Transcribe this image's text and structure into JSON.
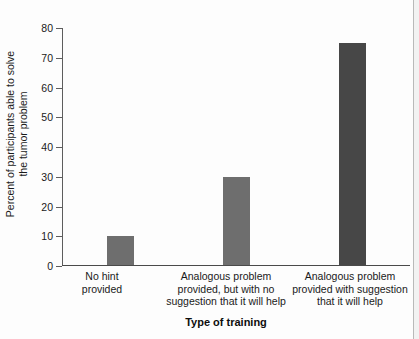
{
  "chart_data": {
    "type": "bar",
    "title": "",
    "subtitle": "",
    "xlabel": "Type of training",
    "ylabel_lines": [
      "Percent of participants able to solve",
      "the tumor problem"
    ],
    "ylabel": "Percent of participants able to solve the tumor problem",
    "categories": [
      "No hint provided",
      "Analogous problem provided, but with no suggestion that it will help",
      "Analogous problem provided with suggestion that it will help"
    ],
    "category_lines": [
      [
        "No hint",
        "provided"
      ],
      [
        "Analogous problem",
        "provided, but with no",
        "suggestion that it will help"
      ],
      [
        "Analogous problem",
        "provided with suggestion",
        "that it will help"
      ]
    ],
    "values": [
      10,
      30,
      75
    ],
    "ylim": [
      0,
      80
    ],
    "yticks": [
      0,
      10,
      20,
      30,
      40,
      50,
      60,
      70,
      80
    ],
    "ytick_labels": [
      "0",
      "10",
      "20",
      "30",
      "40",
      "50",
      "60",
      "70",
      "80"
    ],
    "grid": false,
    "legend": false,
    "legend_position": "none",
    "bar_colors": [
      "#6e6e6e",
      "#6e6e6e",
      "#474747"
    ],
    "bar_width_px": 27,
    "axis_color": "#4a4a4a"
  }
}
